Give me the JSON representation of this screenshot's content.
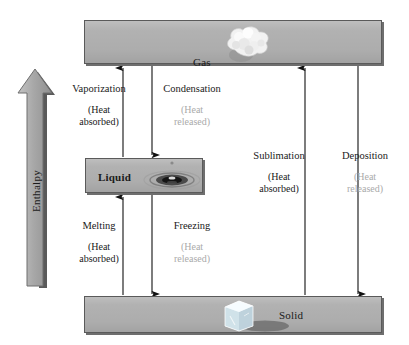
{
  "figure": {
    "axis_arrow_label": "Enthalpy",
    "colors": {
      "box_fill": "#b0b0b0",
      "box_border": "#5a5a5a",
      "arrow": "#111111",
      "heat_absorbed_text": "#1a1a1a",
      "heat_released_text": "#aaaaaa",
      "enthalpy_arrow_fill": "#9a9a9a"
    }
  },
  "phases": {
    "gas": {
      "label": "Gas",
      "art": "vapor-cloud-icon"
    },
    "liquid": {
      "label": "Liquid",
      "art": "water-droplet-ripple-icon"
    },
    "solid": {
      "label": "Solid",
      "art": "ice-cube-icon"
    }
  },
  "processes": {
    "vaporization": {
      "title": "Vaporization",
      "heat_line1": "(Heat",
      "heat_line2": "absorbed)",
      "heat_type": "absorbed",
      "from": "Liquid",
      "to": "Gas",
      "direction": "up"
    },
    "condensation": {
      "title": "Condensation",
      "heat_line1": "(Heat",
      "heat_line2": "released)",
      "heat_type": "released",
      "from": "Gas",
      "to": "Liquid",
      "direction": "down"
    },
    "melting": {
      "title": "Melting",
      "heat_line1": "(Heat",
      "heat_line2": "absorbed)",
      "heat_type": "absorbed",
      "from": "Solid",
      "to": "Liquid",
      "direction": "up"
    },
    "freezing": {
      "title": "Freezing",
      "heat_line1": "(Heat",
      "heat_line2": "released)",
      "heat_type": "released",
      "from": "Liquid",
      "to": "Solid",
      "direction": "down"
    },
    "sublimation": {
      "title": "Sublimation",
      "heat_line1": "(Heat",
      "heat_line2": "absorbed)",
      "heat_type": "absorbed",
      "from": "Solid",
      "to": "Gas",
      "direction": "up"
    },
    "deposition": {
      "title": "Deposition",
      "heat_line1": "(Heat",
      "heat_line2": "released)",
      "heat_type": "released",
      "from": "Gas",
      "to": "Solid",
      "direction": "down"
    }
  }
}
